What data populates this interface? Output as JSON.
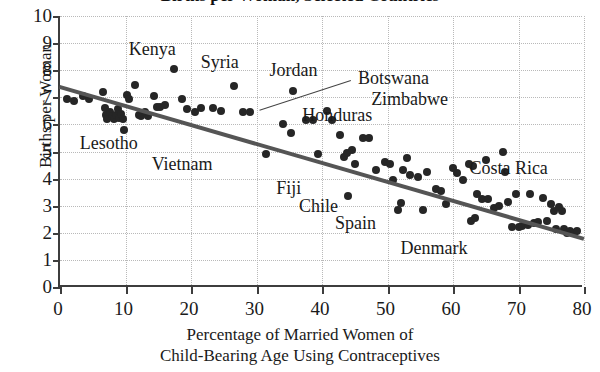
{
  "chart_data": {
    "type": "scatter",
    "title": "Births per Woman, Selected Countries",
    "xlabel_line1": "Percentage of Married Women of",
    "xlabel_line2": "Child-Bearing Age Using Contraceptives",
    "ylabel": "Births per Woman",
    "xlim": [
      0,
      80
    ],
    "ylim": [
      0,
      10
    ],
    "xticks": [
      0,
      10,
      20,
      30,
      40,
      50,
      60,
      70,
      80
    ],
    "yticks": [
      0,
      1,
      2,
      3,
      4,
      5,
      6,
      7,
      8,
      9,
      10
    ],
    "grid": "dotted-both",
    "legend": "none",
    "marker_color": "#262626",
    "trendline": {
      "color": "#555555",
      "x0": 0,
      "y0": 7.45,
      "x1": 80,
      "y1": 1.85,
      "note": "least-squares regression line"
    },
    "points": [
      [
        1.0,
        6.95
      ],
      [
        2.2,
        6.85
      ],
      [
        3.5,
        7.05
      ],
      [
        4.5,
        6.95
      ],
      [
        6.5,
        7.2
      ],
      [
        6.8,
        6.6
      ],
      [
        7.0,
        6.35
      ],
      [
        7.2,
        6.2
      ],
      [
        7.6,
        6.45
      ],
      [
        7.9,
        6.3
      ],
      [
        8.2,
        6.2
      ],
      [
        8.6,
        6.35
      ],
      [
        8.8,
        6.55
      ],
      [
        9.0,
        6.25
      ],
      [
        9.3,
        6.4
      ],
      [
        9.6,
        6.2
      ],
      [
        9.8,
        5.8
      ],
      [
        10.2,
        7.1
      ],
      [
        10.6,
        6.95
      ],
      [
        11.4,
        7.45
      ],
      [
        12.0,
        6.35
      ],
      [
        12.4,
        6.3
      ],
      [
        13.0,
        6.45
      ],
      [
        13.4,
        6.3
      ],
      [
        14.4,
        7.05
      ],
      [
        14.8,
        6.65
      ],
      [
        15.3,
        6.65
      ],
      [
        16.0,
        6.7
      ],
      [
        17.4,
        8.05
      ],
      [
        18.6,
        6.95
      ],
      [
        19.4,
        6.55
      ],
      [
        20.6,
        6.45
      ],
      [
        21.6,
        6.6
      ],
      [
        23.4,
        6.6
      ],
      [
        24.6,
        6.5
      ],
      [
        26.6,
        7.4
      ],
      [
        28.0,
        6.45
      ],
      [
        29.0,
        6.45
      ],
      [
        31.4,
        4.9
      ],
      [
        34.0,
        6.0
      ],
      [
        35.2,
        5.7
      ],
      [
        35.6,
        7.25
      ],
      [
        37.6,
        6.15
      ],
      [
        38.6,
        6.15
      ],
      [
        39.4,
        4.9
      ],
      [
        40.8,
        6.5
      ],
      [
        41.6,
        6.15
      ],
      [
        42.8,
        5.6
      ],
      [
        43.4,
        4.8
      ],
      [
        43.8,
        4.95
      ],
      [
        44.0,
        3.35
      ],
      [
        44.6,
        5.05
      ],
      [
        45.0,
        4.55
      ],
      [
        46.2,
        5.5
      ],
      [
        47.2,
        5.5
      ],
      [
        48.2,
        4.3
      ],
      [
        49.6,
        4.6
      ],
      [
        50.4,
        4.55
      ],
      [
        50.8,
        3.95
      ],
      [
        51.6,
        2.85
      ],
      [
        52.0,
        3.1
      ],
      [
        52.4,
        4.3
      ],
      [
        53.0,
        4.75
      ],
      [
        53.4,
        4.15
      ],
      [
        54.6,
        4.05
      ],
      [
        55.4,
        2.85
      ],
      [
        56.0,
        4.25
      ],
      [
        57.4,
        3.6
      ],
      [
        58.2,
        3.55
      ],
      [
        59.0,
        3.05
      ],
      [
        60.0,
        4.4
      ],
      [
        60.6,
        4.2
      ],
      [
        61.6,
        3.95
      ],
      [
        62.4,
        4.55
      ],
      [
        62.8,
        2.45
      ],
      [
        63.0,
        4.45
      ],
      [
        63.4,
        2.55
      ],
      [
        63.6,
        3.45
      ],
      [
        64.4,
        3.25
      ],
      [
        65.0,
        4.7
      ],
      [
        65.4,
        3.25
      ],
      [
        66.2,
        2.9
      ],
      [
        67.0,
        3.0
      ],
      [
        67.6,
        5.0
      ],
      [
        68.0,
        4.25
      ],
      [
        68.4,
        3.15
      ],
      [
        69.0,
        2.2
      ],
      [
        69.6,
        3.45
      ],
      [
        70.0,
        2.2
      ],
      [
        70.6,
        2.25
      ],
      [
        71.4,
        2.3
      ],
      [
        71.8,
        3.45
      ],
      [
        72.4,
        2.35
      ],
      [
        73.0,
        2.4
      ],
      [
        73.8,
        3.3
      ],
      [
        74.4,
        2.45
      ],
      [
        75.0,
        3.05
      ],
      [
        75.4,
        2.8
      ],
      [
        75.8,
        2.15
      ],
      [
        76.2,
        2.95
      ],
      [
        76.6,
        2.8
      ],
      [
        77.0,
        2.15
      ],
      [
        77.4,
        2.0
      ],
      [
        77.8,
        2.05
      ],
      [
        78.4,
        2.0
      ],
      [
        79.0,
        2.05
      ]
    ],
    "annotations": [
      {
        "label": "Kenya",
        "x": 10.5,
        "y": 8.8
      },
      {
        "label": "Syria",
        "x": 21.5,
        "y": 8.3
      },
      {
        "label": "Jordan",
        "x": 32.0,
        "y": 8.0
      },
      {
        "label": "Botswana",
        "x": 45.5,
        "y": 7.7
      },
      {
        "label": "Zimbabwe",
        "x": 47.5,
        "y": 6.95
      },
      {
        "label": "Honduras",
        "x": 37.0,
        "y": 6.35
      },
      {
        "label": "Lesotho",
        "x": 3.0,
        "y": 5.3
      },
      {
        "label": "Vietnam",
        "x": 14.0,
        "y": 4.55
      },
      {
        "label": "Fiji",
        "x": 33.0,
        "y": 3.65
      },
      {
        "label": "Chile",
        "x": 36.5,
        "y": 3.0
      },
      {
        "label": "Spain",
        "x": 42.0,
        "y": 2.35
      },
      {
        "label": "Denmark",
        "x": 52.0,
        "y": 1.45
      },
      {
        "label": "Costa Rica",
        "x": 62.5,
        "y": 4.4
      }
    ],
    "leader_line": {
      "x0": 44.5,
      "y0": 7.6,
      "x1": 30.5,
      "y1": 6.5
    }
  }
}
